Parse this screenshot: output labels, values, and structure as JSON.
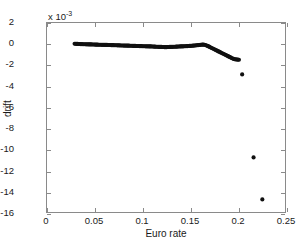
{
  "chart_data": {
    "type": "scatter",
    "title": "",
    "xlabel": "Euro rate",
    "ylabel": "drift",
    "y_multiplier_base": "x 10",
    "y_multiplier_exp": "-3",
    "y_scale": 0.001,
    "xlim": [
      0,
      0.25
    ],
    "ylim": [
      -16,
      2
    ],
    "xticks": [
      0,
      0.05,
      0.1,
      0.15,
      0.2,
      0.25
    ],
    "xtick_labels": [
      "0",
      "0.05",
      "0.1",
      "0.15",
      "0.2",
      "0.25"
    ],
    "yticks": [
      2,
      0,
      -2,
      -4,
      -6,
      -8,
      -10,
      -12,
      -14,
      -16
    ],
    "ytick_labels": [
      "2",
      "0",
      "-2",
      "-4",
      "-6",
      "-8",
      "-10",
      "-12",
      "-14",
      "-16"
    ],
    "grid": false,
    "legend": null,
    "marker_color": "#101010",
    "marker_size": 2.1,
    "series": [
      {
        "name": "drift-trace",
        "description": "dense marker cluster forming a quasi-continuous trace",
        "x": [
          0.029,
          0.03,
          0.0311,
          0.0322,
          0.0333,
          0.0344,
          0.0355,
          0.0366,
          0.0377,
          0.0388,
          0.0399,
          0.041,
          0.0421,
          0.0432,
          0.0443,
          0.0454,
          0.0465,
          0.0476,
          0.0487,
          0.0498,
          0.0509,
          0.052,
          0.0531,
          0.0542,
          0.0553,
          0.0564,
          0.0575,
          0.0586,
          0.0597,
          0.0608,
          0.0619,
          0.063,
          0.0641,
          0.0652,
          0.0663,
          0.0674,
          0.0685,
          0.0696,
          0.0707,
          0.0718,
          0.0729,
          0.074,
          0.0751,
          0.0762,
          0.0773,
          0.0784,
          0.0795,
          0.0806,
          0.0817,
          0.0828,
          0.0839,
          0.085,
          0.0861,
          0.0872,
          0.0883,
          0.0894,
          0.0905,
          0.0916,
          0.0927,
          0.0938,
          0.0949,
          0.096,
          0.0971,
          0.0982,
          0.0993,
          0.1004,
          0.1015,
          0.1026,
          0.1037,
          0.1048,
          0.1059,
          0.107,
          0.1081,
          0.1092,
          0.1103,
          0.1114,
          0.1125,
          0.1136,
          0.1147,
          0.1158,
          0.1169,
          0.118,
          0.1191,
          0.1202,
          0.1213,
          0.1224,
          0.1235,
          0.1246,
          0.1257,
          0.1268,
          0.1279,
          0.129,
          0.1301,
          0.1312,
          0.1323,
          0.1334,
          0.1345,
          0.1356,
          0.1367,
          0.1378,
          0.1389,
          0.14,
          0.1411,
          0.1422,
          0.1433,
          0.1444,
          0.1455,
          0.1466,
          0.1477,
          0.1488,
          0.1499,
          0.151,
          0.1521,
          0.1532,
          0.1543,
          0.1554,
          0.1565,
          0.1576,
          0.1587,
          0.1598,
          0.1609,
          0.162,
          0.1631,
          0.1642,
          0.1653,
          0.1664,
          0.1675,
          0.1686,
          0.1697,
          0.1708,
          0.1719,
          0.173,
          0.1741,
          0.1752,
          0.1763,
          0.1774,
          0.1785,
          0.1796,
          0.1807,
          0.1818,
          0.1829,
          0.184,
          0.1851,
          0.1862,
          0.1873,
          0.1884,
          0.1895,
          0.1906,
          0.1917,
          0.1928,
          0.1939,
          0.195,
          0.1961,
          0.1972,
          0.1983,
          0.1994,
          0.2005,
          0.2016
        ],
        "y": [
          0.02,
          0.02,
          0.01,
          0.01,
          0.0,
          0.0,
          -0.01,
          -0.01,
          -0.02,
          -0.02,
          -0.02,
          -0.03,
          -0.03,
          -0.03,
          -0.04,
          -0.04,
          -0.04,
          -0.05,
          -0.05,
          -0.05,
          -0.06,
          -0.06,
          -0.06,
          -0.07,
          -0.07,
          -0.07,
          -0.08,
          -0.08,
          -0.08,
          -0.09,
          -0.09,
          -0.09,
          -0.1,
          -0.1,
          -0.1,
          -0.11,
          -0.11,
          -0.11,
          -0.12,
          -0.12,
          -0.12,
          -0.13,
          -0.13,
          -0.13,
          -0.14,
          -0.14,
          -0.14,
          -0.15,
          -0.15,
          -0.15,
          -0.16,
          -0.16,
          -0.16,
          -0.17,
          -0.17,
          -0.17,
          -0.18,
          -0.18,
          -0.18,
          -0.19,
          -0.19,
          -0.19,
          -0.2,
          -0.2,
          -0.2,
          -0.21,
          -0.21,
          -0.21,
          -0.22,
          -0.22,
          -0.22,
          -0.23,
          -0.23,
          -0.23,
          -0.24,
          -0.24,
          -0.25,
          -0.25,
          -0.26,
          -0.26,
          -0.27,
          -0.27,
          -0.28,
          -0.28,
          -0.29,
          -0.29,
          -0.3,
          -0.3,
          -0.3,
          -0.29,
          -0.29,
          -0.28,
          -0.28,
          -0.27,
          -0.27,
          -0.26,
          -0.26,
          -0.25,
          -0.25,
          -0.24,
          -0.24,
          -0.23,
          -0.23,
          -0.22,
          -0.22,
          -0.21,
          -0.21,
          -0.2,
          -0.2,
          -0.19,
          -0.18,
          -0.18,
          -0.17,
          -0.16,
          -0.15,
          -0.14,
          -0.13,
          -0.12,
          -0.11,
          -0.1,
          -0.08,
          -0.07,
          -0.06,
          -0.06,
          -0.07,
          -0.1,
          -0.14,
          -0.18,
          -0.23,
          -0.28,
          -0.33,
          -0.38,
          -0.43,
          -0.48,
          -0.53,
          -0.58,
          -0.63,
          -0.68,
          -0.73,
          -0.78,
          -0.83,
          -0.88,
          -0.93,
          -0.98,
          -1.03,
          -1.08,
          -1.13,
          -1.18,
          -1.23,
          -1.28,
          -1.33,
          -1.38,
          -1.42,
          -1.45,
          -1.47,
          -1.48,
          -1.49,
          -1.5
        ]
      },
      {
        "name": "outliers",
        "description": "isolated far-from-trend markers at high Euro rate",
        "x": [
          0.205,
          0.217,
          0.2262
        ],
        "y": [
          -2.9,
          -10.8,
          -14.8
        ]
      }
    ]
  }
}
